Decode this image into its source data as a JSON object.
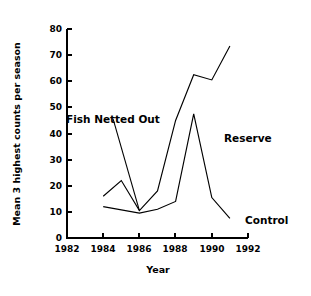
{
  "chart_data": {
    "type": "line",
    "title": "",
    "xlabel": "Year",
    "ylabel": "Mean 3 highest counts per season",
    "xlim": [
      1982,
      1992
    ],
    "ylim": [
      0,
      80
    ],
    "xticks": [
      1982,
      1984,
      1986,
      1988,
      1990,
      1992
    ],
    "xtick_labels": [
      "1982",
      "1984",
      "1986",
      "1988",
      "1990",
      "1992"
    ],
    "yticks": [
      0,
      10,
      20,
      30,
      40,
      50,
      60,
      70,
      80
    ],
    "ytick_labels": [
      "0",
      "10",
      "20",
      "30",
      "40",
      "50",
      "60",
      "70",
      "80"
    ],
    "grid": false,
    "legend_position": "inline-annotations",
    "series": [
      {
        "name": "Reserve",
        "x": [
          1984,
          1985,
          1986,
          1987,
          1988,
          1989,
          1990,
          1991
        ],
        "values": [
          16,
          22,
          10.5,
          18,
          45,
          62.5,
          60.5,
          73.5
        ]
      },
      {
        "name": "Control",
        "x": [
          1984,
          1986,
          1987,
          1988,
          1989,
          1990,
          1991
        ],
        "values": [
          12,
          9.5,
          11,
          14,
          47.5,
          15.5,
          7.5
        ]
      }
    ],
    "annotations": [
      {
        "text": "Fish Netted Out",
        "points_to_x": 1986,
        "points_to_y": 10.5
      },
      {
        "text": "Reserve",
        "at_x": 1989.8,
        "at_y": 42
      },
      {
        "text": "Control",
        "at_x": 1990.7,
        "at_y": 8
      }
    ]
  },
  "axes": {
    "x_title": "Year",
    "y_title": "Mean 3 highest counts per season"
  },
  "labels": {
    "fish_netted_out": "Fish Netted Out",
    "reserve": "Reserve",
    "control": "Control"
  },
  "colors": {
    "line": "#000000",
    "background": "#ffffff",
    "text": "#000000"
  }
}
